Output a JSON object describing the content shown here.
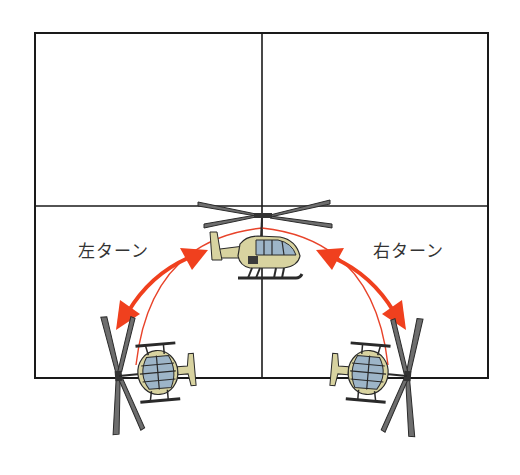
{
  "diagram": {
    "labels": {
      "left_turn": "左ターン",
      "right_turn": "右ターン"
    },
    "grid": {
      "rows": 2,
      "columns": 2,
      "line_color": "#1a1a1a"
    },
    "path": {
      "shape": "arc",
      "color": "#e8432a"
    },
    "arrows": [
      {
        "name": "left-turn-arrow",
        "direction": "bidirectional",
        "color": "#f0401e"
      },
      {
        "name": "right-turn-arrow",
        "direction": "bidirectional",
        "color": "#f0401e"
      }
    ],
    "helicopters": [
      {
        "position": "top-center",
        "orientation": "side view, nose right"
      },
      {
        "position": "bottom-left",
        "orientation": "front view, rotated (banked left)"
      },
      {
        "position": "bottom-right",
        "orientation": "front view, rotated (banked right)"
      }
    ],
    "colors": {
      "fuselage": "#d8d3a0",
      "fuselage_shadow": "#a9a173",
      "canopy": "#9db5c8",
      "rotor": "#6e6e6e",
      "outline": "#2a2a2a"
    }
  }
}
